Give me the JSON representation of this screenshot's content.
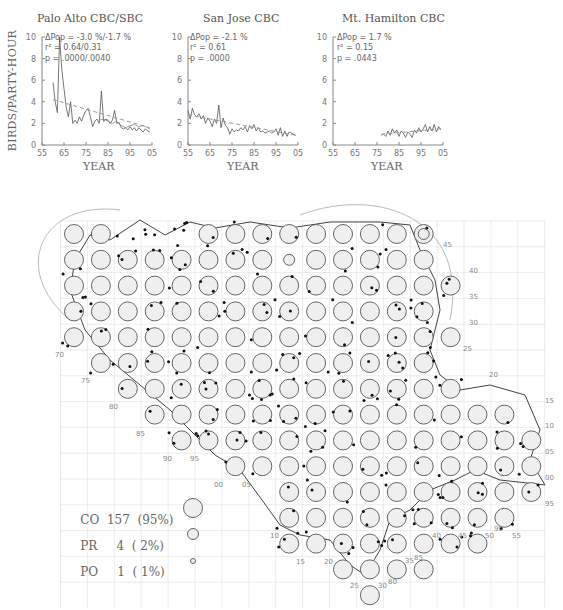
{
  "figure": {
    "y_axis_label": "BIRDS/PARTY-HOUR",
    "x_axis_label": "YEAR"
  },
  "plots": [
    {
      "title": "Palo Alto CBC/SBC",
      "stat_dpop": "ΔPop = -3.0 %/-1.7 %",
      "stat_r2": "r² = 0.64/0.31",
      "stat_p": "p = .0000/.0040"
    },
    {
      "title": "San Jose CBC",
      "stat_dpop": "ΔPop =  -2.1 %",
      "stat_r2": "r² = 0.61",
      "stat_p": "p = .0000"
    },
    {
      "title": "Mt. Hamilton CBC",
      "stat_dpop": "ΔPop =  1.7 %",
      "stat_r2": "r² = 0.15",
      "stat_p": "p = .0443"
    }
  ],
  "legend": {
    "co": {
      "code": "CO",
      "count": "157",
      "pct": "(95%)"
    },
    "pr": {
      "code": "PR",
      "count": "4",
      "pct": "( 2%)"
    },
    "po": {
      "code": "PO",
      "count": "1",
      "pct": "( 1%)"
    }
  },
  "map": {
    "right_labels": [
      "45",
      "40",
      "35",
      "30",
      "25",
      "20",
      "15",
      "10",
      "05",
      "00",
      "95"
    ],
    "left_labels": [
      "70",
      "75",
      "80",
      "85",
      "90",
      "95",
      "00",
      "05"
    ],
    "bottom_labels": [
      "10",
      "15",
      "20",
      "25",
      "30",
      "35",
      "40",
      "45",
      "50",
      "55"
    ],
    "other_labels": [
      "80",
      "85",
      "90"
    ]
  },
  "chart_data": [
    {
      "type": "line",
      "title": "Palo Alto CBC/SBC",
      "xlabel": "YEAR",
      "ylabel": "BIRDS/PARTY-HOUR",
      "xlim": [
        1955,
        2005
      ],
      "ylim": [
        0,
        10
      ],
      "xticks": [
        "55",
        "65",
        "75",
        "85",
        "95",
        "05"
      ],
      "yticks": [
        0,
        2,
        4,
        6,
        8,
        10
      ],
      "annotations": [
        "ΔPop = -3.0 %/-1.7 %",
        "r² = 0.64/0.31",
        "p = .0000/.0040"
      ],
      "series": [
        {
          "name": "CBC",
          "x": [
            1960,
            1961,
            1962,
            1963,
            1964,
            1965,
            1966,
            1967,
            1968,
            1969,
            1970,
            1971,
            1972,
            1973,
            1974,
            1975,
            1976,
            1977,
            1978,
            1979,
            1980,
            1981,
            1982,
            1983,
            1984,
            1985,
            1986,
            1987,
            1988,
            1989,
            1990,
            1991,
            1992,
            1993,
            1994,
            1995,
            1996,
            1997,
            1998,
            1999,
            2000,
            2001,
            2002,
            2003,
            2004
          ],
          "y": [
            5.8,
            4.0,
            3.0,
            10.0,
            7.0,
            5.2,
            3.5,
            2.6,
            4.0,
            2.0,
            2.3,
            2.0,
            2.6,
            2.2,
            2.8,
            3.2,
            3.4,
            2.6,
            1.7,
            2.2,
            2.4,
            2.0,
            5.0,
            2.2,
            2.4,
            2.3,
            2.0,
            2.3,
            3.2,
            2.0,
            2.1,
            1.6,
            1.5,
            1.6,
            1.4,
            1.7,
            1.4,
            1.6,
            1.3,
            1.6,
            1.4,
            1.2,
            1.5,
            1.3,
            1.2
          ]
        },
        {
          "name": "SBC",
          "x": [
            1981,
            1983,
            1985,
            1987,
            1989,
            1991,
            1993,
            1995,
            1997,
            1999,
            2001,
            2003,
            2004
          ],
          "y": [
            2.3,
            2.4,
            2.2,
            2.0,
            2.2,
            1.8,
            1.6,
            1.8,
            1.9,
            1.7,
            1.8,
            1.6,
            1.5
          ]
        },
        {
          "name": "trend",
          "x": [
            1960,
            2004
          ],
          "y": [
            4.2,
            1.6
          ]
        }
      ]
    },
    {
      "type": "line",
      "title": "San Jose CBC",
      "xlabel": "YEAR",
      "ylabel": "BIRDS/PARTY-HOUR",
      "xlim": [
        1955,
        2005
      ],
      "ylim": [
        0,
        10
      ],
      "xticks": [
        "55",
        "65",
        "75",
        "85",
        "95",
        "05"
      ],
      "yticks": [
        0,
        2,
        4,
        6,
        8,
        10
      ],
      "annotations": [
        "ΔPop = -2.1 %",
        "r² = 0.61",
        "p = .0000"
      ],
      "series": [
        {
          "name": "CBC",
          "x": [
            1955,
            1956,
            1957,
            1958,
            1959,
            1960,
            1961,
            1962,
            1963,
            1964,
            1965,
            1966,
            1967,
            1968,
            1969,
            1970,
            1971,
            1972,
            1973,
            1974,
            1975,
            1976,
            1977,
            1978,
            1979,
            1980,
            1981,
            1982,
            1983,
            1984,
            1985,
            1986,
            1987,
            1988,
            1989,
            1990,
            1991,
            1992,
            1993,
            1994,
            1995,
            1996,
            1997,
            1998,
            1999,
            2000,
            2001,
            2002,
            2003,
            2004
          ],
          "y": [
            3.2,
            2.4,
            3.4,
            2.8,
            2.6,
            2.9,
            2.4,
            2.7,
            2.0,
            2.5,
            2.2,
            1.7,
            2.4,
            2.0,
            3.7,
            1.6,
            2.5,
            1.8,
            1.6,
            1.0,
            1.5,
            1.2,
            1.4,
            1.3,
            1.6,
            1.4,
            1.7,
            1.2,
            1.8,
            1.5,
            1.9,
            1.3,
            1.6,
            1.2,
            1.3,
            1.1,
            1.2,
            1.3,
            1.1,
            1.2,
            1.5,
            0.9,
            1.6,
            0.8,
            1.3,
            0.8,
            1.2,
            1.1,
            1.0,
            0.9
          ]
        },
        {
          "name": "trend",
          "x": [
            1955,
            2004
          ],
          "y": [
            2.8,
            0.9
          ]
        }
      ]
    },
    {
      "type": "line",
      "title": "Mt. Hamilton CBC",
      "xlabel": "YEAR",
      "ylabel": "BIRDS/PARTY-HOUR",
      "xlim": [
        1955,
        2005
      ],
      "ylim": [
        0,
        10
      ],
      "xticks": [
        "55",
        "65",
        "75",
        "85",
        "95",
        "05"
      ],
      "yticks": [
        0,
        2,
        4,
        6,
        8,
        10
      ],
      "annotations": [
        "ΔPop = 1.7 %",
        "r² = 0.15",
        "p = .0443"
      ],
      "series": [
        {
          "name": "CBC",
          "x": [
            1977,
            1978,
            1979,
            1980,
            1981,
            1982,
            1983,
            1984,
            1985,
            1986,
            1987,
            1988,
            1989,
            1990,
            1991,
            1992,
            1993,
            1994,
            1995,
            1996,
            1997,
            1998,
            1999,
            2000,
            2001,
            2002,
            2003,
            2004
          ],
          "y": [
            0.9,
            1.0,
            0.8,
            1.3,
            0.9,
            1.5,
            1.1,
            1.4,
            0.8,
            1.3,
            1.1,
            0.7,
            1.2,
            1.0,
            0.7,
            1.4,
            1.1,
            1.6,
            1.2,
            1.5,
            1.9,
            1.2,
            1.7,
            1.3,
            1.9,
            1.2,
            1.7,
            1.4
          ]
        },
        {
          "name": "trend",
          "x": [
            1977,
            2004
          ],
          "y": [
            1.0,
            1.5
          ]
        }
      ]
    }
  ]
}
